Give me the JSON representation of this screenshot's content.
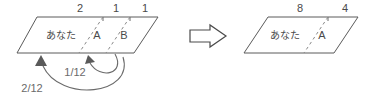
{
  "diagram": {
    "title": "",
    "type": "parallelogram-partition-transfer",
    "colors": {
      "background": "#ffffff",
      "edge": "#5a5a5a",
      "dashed": "#8a8a8a",
      "text": "#4a4a4a",
      "fraction_text": "#6a6a6a",
      "arrow": "#6a6a6a"
    },
    "left_shape": {
      "name": "left-parallelogram",
      "top_numbers": [
        "2",
        "1",
        "1"
      ],
      "segments": [
        {
          "label": "あなた"
        },
        {
          "label": "A"
        },
        {
          "label": "B"
        }
      ]
    },
    "transition_arrow": {
      "name": "transformation-arrow",
      "glyph": "right-arrow"
    },
    "right_shape": {
      "name": "right-parallelogram",
      "top_numbers": [
        "8",
        "4"
      ],
      "segments": [
        {
          "label": "あなた"
        },
        {
          "label": "A"
        }
      ]
    },
    "transfer_arcs": [
      {
        "name": "arc-one-twelfth",
        "label": "1/12"
      },
      {
        "name": "arc-two-twelfths",
        "label": "2/12"
      }
    ]
  }
}
